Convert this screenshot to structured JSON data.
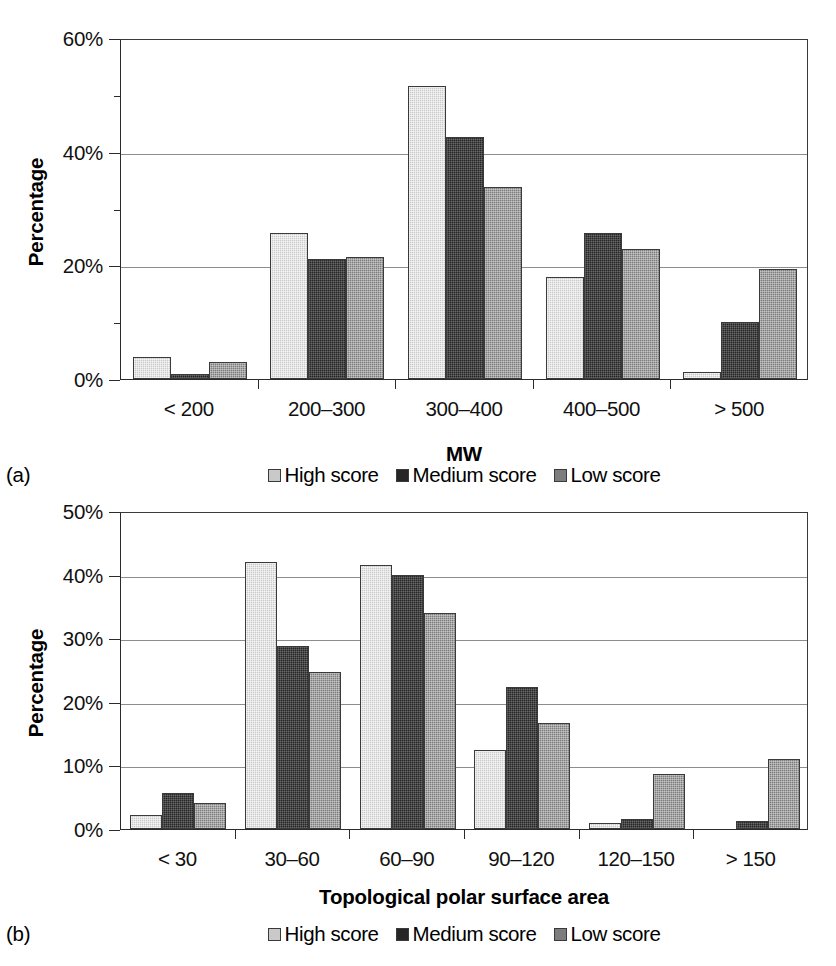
{
  "figure": {
    "panels": [
      {
        "letter": "(a)",
        "ylabel": "Percentage",
        "xlabel": "MW",
        "ytick_labels": [
          "0%",
          "20%",
          "40%",
          "60%"
        ],
        "xtick_labels": [
          "< 200",
          "200–300",
          "300–400",
          "400–500",
          "> 500"
        ],
        "legend": [
          "High score",
          "Medium score",
          "Low score"
        ]
      },
      {
        "letter": "(b)",
        "ylabel": "Percentage",
        "xlabel": "Topological polar surface area",
        "ytick_labels": [
          "0%",
          "10%",
          "20%",
          "30%",
          "40%",
          "50%"
        ],
        "xtick_labels": [
          "< 30",
          "30–60",
          "60–90",
          "90–120",
          "120–150",
          "> 150"
        ],
        "legend": [
          "High score",
          "Medium score",
          "Low score"
        ]
      }
    ]
  },
  "colors": {
    "high_score": "#c9c9c9",
    "medium_score": "#262626",
    "low_score": "#7d7d7d",
    "axis": "#2b2b2b",
    "gridline": "#8d8d8d",
    "background": "#ffffff"
  },
  "chart_data": [
    {
      "type": "bar",
      "panel": "(a)",
      "title": "",
      "xlabel": "MW",
      "ylabel": "Percentage",
      "categories": [
        "< 200",
        "200–300",
        "300–400",
        "400–500",
        "> 500"
      ],
      "series": [
        {
          "name": "High score",
          "values": [
            3.8,
            25.7,
            51.5,
            18.0,
            1.2
          ]
        },
        {
          "name": "Medium score",
          "values": [
            0.9,
            21.2,
            42.5,
            25.7,
            10.0
          ]
        },
        {
          "name": "Low score",
          "values": [
            3.0,
            21.4,
            33.8,
            22.8,
            19.3
          ]
        }
      ],
      "ylim": [
        0,
        60
      ],
      "ytick_values": [
        0,
        20,
        40,
        60
      ],
      "yminor_values": [
        10,
        30,
        50
      ],
      "yunit": "%",
      "grid": true,
      "legend_position": "bottom"
    },
    {
      "type": "bar",
      "panel": "(b)",
      "title": "",
      "xlabel": "Topological polar surface area",
      "ylabel": "Percentage",
      "categories": [
        "< 30",
        "30–60",
        "60–90",
        "90–120",
        "120–150",
        "> 150"
      ],
      "series": [
        {
          "name": "High score",
          "values": [
            2.2,
            42.0,
            41.5,
            12.5,
            0.9,
            0.0
          ]
        },
        {
          "name": "Medium score",
          "values": [
            5.6,
            28.7,
            40.0,
            22.3,
            1.5,
            1.3
          ]
        },
        {
          "name": "Low score",
          "values": [
            4.1,
            24.7,
            34.0,
            16.7,
            8.7,
            11.0
          ]
        }
      ],
      "ylim": [
        0,
        50
      ],
      "ytick_values": [
        0,
        10,
        20,
        30,
        40,
        50
      ],
      "yminor_values": [],
      "yunit": "%",
      "grid": true,
      "legend_position": "bottom"
    }
  ]
}
